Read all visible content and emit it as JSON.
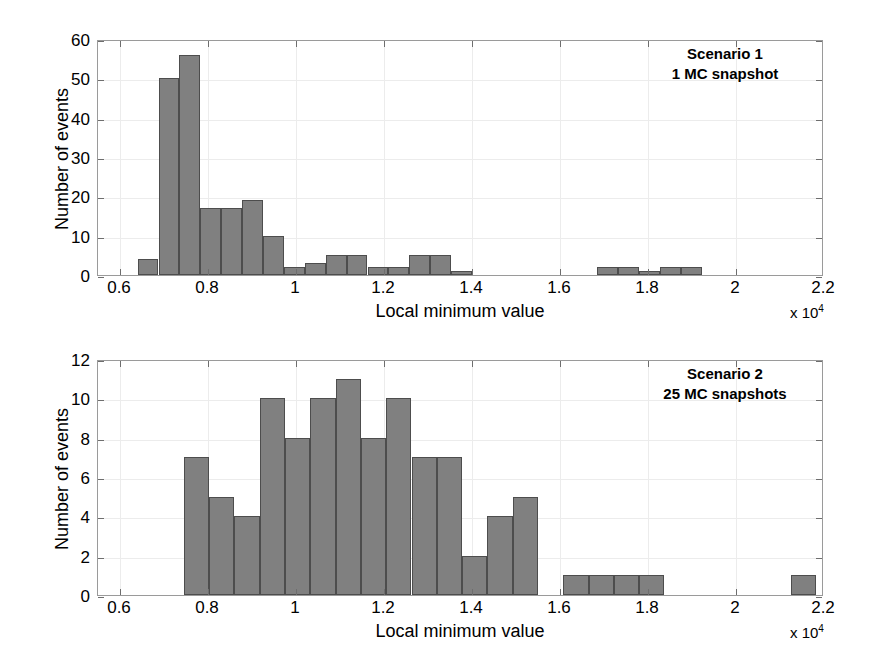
{
  "figure": {
    "background": "#ffffff",
    "bar_fill": "#808080",
    "bar_edge": "#4d4d4d",
    "axis_color": "#9a9a9a",
    "grid_color": "#ececec"
  },
  "panels": [
    {
      "id": "scenario-1",
      "annotation_line1": "Scenario 1",
      "annotation_line2": "1 MC snapshot",
      "xlabel": "Local minimum value",
      "ylabel": "Number of events",
      "exponent_prefix": "x 10",
      "exponent_power": "4",
      "xticks": [
        "0.6",
        "0.8",
        "1",
        "1.2",
        "1.4",
        "1.6",
        "1.8",
        "2",
        "2.2"
      ],
      "yticks": [
        "0",
        "10",
        "20",
        "30",
        "40",
        "50",
        "60"
      ]
    },
    {
      "id": "scenario-2",
      "annotation_line1": "Scenario 2",
      "annotation_line2": "25 MC snapshots",
      "xlabel": "Local minimum value",
      "ylabel": "Number of events",
      "exponent_prefix": "x 10",
      "exponent_power": "4",
      "xticks": [
        "0.6",
        "0.8",
        "1",
        "1.2",
        "1.4",
        "1.6",
        "1.8",
        "2",
        "2.2"
      ],
      "yticks": [
        "0",
        "2",
        "4",
        "6",
        "8",
        "10",
        "12"
      ]
    }
  ],
  "chart_data": [
    {
      "type": "bar",
      "title": "Scenario 1 — 1 MC snapshot",
      "xlabel": "Local minimum value",
      "ylabel": "Number of events",
      "x_multiplier": "x 10^4",
      "xlim": [
        0.55,
        2.2
      ],
      "ylim": [
        0,
        60
      ],
      "ytick_step": 10,
      "xtick_step": 0.2,
      "grid": true,
      "legend": "none",
      "bin_width": 0.0475,
      "bin_edges": [
        0.64,
        0.6875,
        0.735,
        0.7825,
        0.83,
        0.8775,
        0.925,
        0.9725,
        1.02,
        1.0675,
        1.115,
        1.1625,
        1.21,
        1.2575,
        1.305,
        1.3525,
        1.4,
        1.4475,
        1.495,
        1.5425,
        1.59,
        1.6375,
        1.685,
        1.7325,
        1.78,
        1.8275,
        1.875,
        1.9225,
        1.97,
        2.0175
      ],
      "bin_centers": [
        0.66375,
        0.71125,
        0.75875,
        0.80625,
        0.85375,
        0.90125,
        0.94875,
        0.99625,
        1.04375,
        1.09125,
        1.13875,
        1.18625,
        1.23375,
        1.28125,
        1.32875,
        1.37625,
        1.42375,
        1.47125,
        1.51875,
        1.56625,
        1.61375,
        1.66125,
        1.70875,
        1.75625,
        1.80375,
        1.85125,
        1.89875,
        1.94625,
        1.99375
      ],
      "values": [
        4,
        50,
        56,
        17,
        17,
        19,
        10,
        2,
        3,
        5,
        5,
        2,
        2,
        5,
        5,
        1,
        0,
        0,
        0,
        0,
        0,
        0,
        2,
        2,
        1,
        2,
        2,
        0,
        0
      ]
    },
    {
      "type": "bar",
      "title": "Scenario 2 — 25 MC snapshots",
      "xlabel": "Local minimum value",
      "ylabel": "Number of events",
      "x_multiplier": "x 10^4",
      "xlim": [
        0.55,
        2.2
      ],
      "ylim": [
        0,
        12
      ],
      "ytick_step": 2,
      "xtick_step": 0.2,
      "grid": true,
      "legend": "none",
      "bin_width": 0.0575,
      "bin_edges": [
        0.745,
        0.8025,
        0.86,
        0.9175,
        0.975,
        1.0325,
        1.09,
        1.1475,
        1.205,
        1.2625,
        1.32,
        1.3775,
        1.435,
        1.4925,
        1.55,
        1.6075,
        1.665,
        1.7225,
        1.78,
        1.8375,
        1.895,
        1.9525,
        2.01,
        2.0675,
        2.125,
        2.1825
      ],
      "bin_centers": [
        0.77375,
        0.83125,
        0.88875,
        0.94625,
        1.00375,
        1.06125,
        1.11875,
        1.17625,
        1.23375,
        1.29125,
        1.34875,
        1.40625,
        1.46375,
        1.52125,
        1.57875,
        1.63625,
        1.69375,
        1.75125,
        1.80875,
        1.86625,
        1.92375,
        1.98125,
        2.03875,
        2.09625,
        2.15375
      ],
      "values": [
        7,
        5,
        4,
        10,
        8,
        10,
        11,
        8,
        10,
        7,
        7,
        2,
        4,
        5,
        0,
        1,
        1,
        1,
        1,
        0,
        0,
        0,
        0,
        0,
        1
      ]
    }
  ]
}
